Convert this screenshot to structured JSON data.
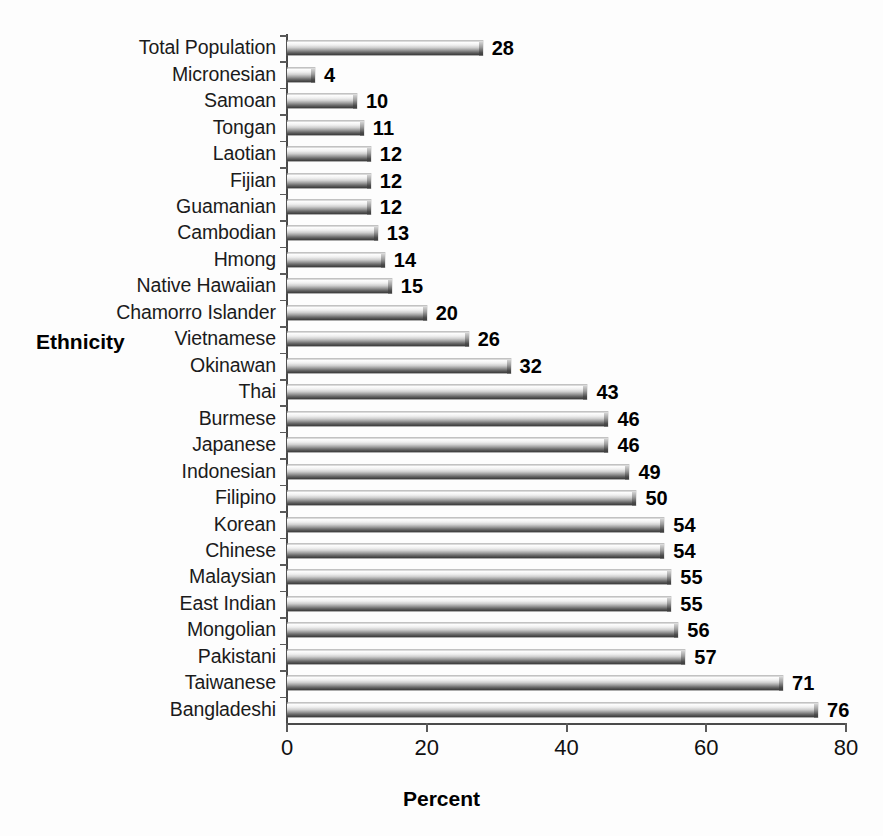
{
  "chart_data": {
    "type": "bar",
    "orientation": "horizontal",
    "title": "",
    "xlabel": "Percent",
    "ylabel": "Ethnicity",
    "xlim": [
      0,
      80
    ],
    "xticks": [
      0,
      20,
      40,
      60,
      80
    ],
    "grid": false,
    "legend": null,
    "categories": [
      "Total Population",
      "Micronesian",
      "Samoan",
      "Tongan",
      "Laotian",
      "Fijian",
      "Guamanian",
      "Cambodian",
      "Hmong",
      "Native Hawaiian",
      "Chamorro Islander",
      "Vietnamese",
      "Okinawan",
      "Thai",
      "Burmese",
      "Japanese",
      "Indonesian",
      "Filipino",
      "Korean",
      "Chinese",
      "Malaysian",
      "East Indian",
      "Mongolian",
      "Pakistani",
      "Taiwanese",
      "Bangladeshi"
    ],
    "values": [
      28,
      4,
      10,
      11,
      12,
      12,
      12,
      13,
      14,
      15,
      20,
      26,
      32,
      43,
      46,
      46,
      49,
      50,
      54,
      54,
      55,
      55,
      56,
      57,
      71,
      76
    ],
    "value_labels": [
      "28",
      "4",
      "10",
      "11",
      "12",
      "12",
      "12",
      "13",
      "14",
      "15",
      "20",
      "26",
      "32",
      "43",
      "46",
      "46",
      "49",
      "50",
      "54",
      "54",
      "55",
      "55",
      "56",
      "57",
      "71",
      "76"
    ],
    "xtick_labels": [
      "0",
      "20",
      "40",
      "60",
      "80"
    ],
    "colors": {
      "bar_light": "#ffffff",
      "bar_dark": "#3c3c3c",
      "axis": "#4a4a4a",
      "text": "#000000",
      "background": "#ffffff"
    }
  }
}
